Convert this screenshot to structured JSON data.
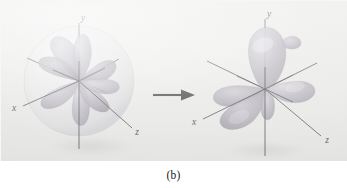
{
  "figure": {
    "caption": "(b)",
    "background_color": "#ececeb",
    "plate_height_px": 161
  },
  "transition": {
    "arrow_icon": "right-arrow-icon",
    "direction": "right"
  },
  "panels": [
    {
      "id": "left-orbital",
      "role": "before",
      "description": "Set of unhybridized atomic orbitals enclosed in a translucent sphere",
      "has_enclosing_sphere": true,
      "lobe_count": 8,
      "lobe_color": "#a7a2ae",
      "sphere_color": "#d9d9dd",
      "axes": [
        {
          "name": "y",
          "label": "y",
          "label_x": 82,
          "label_y": 20
        },
        {
          "name": "x",
          "label": "x",
          "label_x": 13,
          "label_y": 110
        },
        {
          "name": "z",
          "label": "z",
          "label_x": 135,
          "label_y": 133
        }
      ]
    },
    {
      "id": "right-orbital",
      "role": "after",
      "description": "Hybridized orbitals with three large lobes",
      "has_enclosing_sphere": false,
      "lobe_count": 4,
      "lobe_color": "#a8a3ae",
      "axes": [
        {
          "name": "y",
          "label": "y",
          "label_x": 260,
          "label_y": 22
        },
        {
          "name": "x",
          "label": "x",
          "label_x": 191,
          "label_y": 123
        },
        {
          "name": "z",
          "label": "z",
          "label_x": 326,
          "label_y": 142
        }
      ]
    }
  ],
  "colors": {
    "axis_line": "#2b2b2f",
    "arrow": "#101010",
    "caption_text": "#1a1a1a",
    "plate": "#ececeb"
  }
}
